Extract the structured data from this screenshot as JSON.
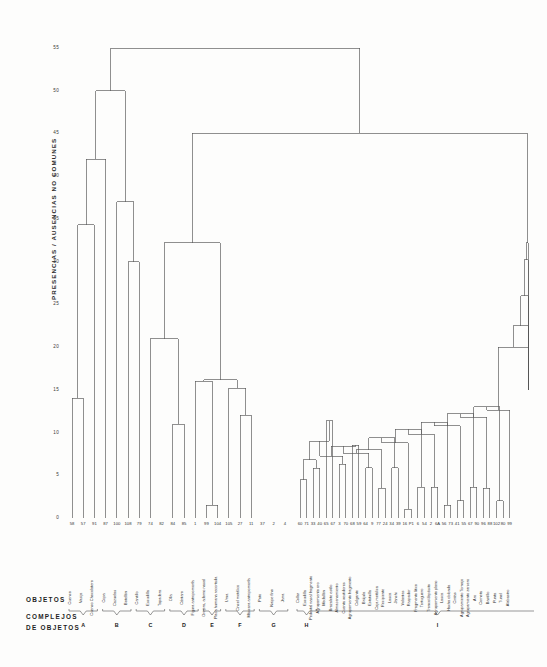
{
  "figure": {
    "kind": "dendrogram",
    "caption_objetos": "OBJETOS",
    "caption_complejos_line1": "COMPLEJOS",
    "caption_complejos_line2": "DE OBJETOS",
    "line_color": "#555555",
    "background": "#fdfdfc"
  },
  "chart_data": {
    "type": "dendrogram",
    "title": "",
    "xlabel": "OBJETOS",
    "ylabel": "PRESENCIAS / AUSENCIAS NO COMUNES",
    "ylim": [
      0,
      55
    ],
    "yticks": [
      0,
      5,
      10,
      15,
      20,
      25,
      30,
      35,
      40,
      45,
      50,
      55
    ],
    "grid": false,
    "legend": "none",
    "orientation": "vertical",
    "n_leaves": 60,
    "leaf_ids": [
      "58",
      "57",
      "91",
      "87",
      "100",
      "108",
      "79",
      "74",
      "82",
      "84",
      "85",
      "1",
      "99",
      "104",
      "105",
      "27",
      "11",
      "37",
      "2",
      "4",
      "60",
      "71",
      "33",
      "40",
      "65",
      "67",
      "3",
      "70",
      "68",
      "59",
      "64",
      "9",
      "77",
      "24",
      "34",
      "39",
      "16",
      "P1",
      "6",
      "54",
      "2",
      "6A",
      "56",
      "73",
      "41",
      "55",
      "67",
      "90",
      "96",
      "88",
      "102",
      "80",
      "99"
    ],
    "leaf_labels": [
      "Cuenco",
      "Vasija",
      "Cuenco Chocolatero",
      "Copa",
      "Cazuelas",
      "Botellón",
      "Cantillo",
      "Escudilla",
      "Tapadera",
      "Olla",
      "Cántaro",
      "Figura antropomorfa",
      "Orejera, adorno nasal",
      "Placa humana recortada",
      "Urna",
      "Cincel metálico",
      "Máscara antropomorfa",
      "Pato",
      "Naipe fino",
      "Jarra",
      "Collar",
      "Escudilla",
      "Pedestal nasal fragmento",
      "Agrupamiento oro",
      "Medallón",
      "Brazalete estilo",
      "Almacenamiento",
      "Cuenta vestidores",
      "Agrupamiento fragmento",
      "Colgante",
      "Brújula",
      "Estatuilla",
      "Caja metálica",
      "Recipiente",
      "Lasca",
      "Janchi",
      "Volantes",
      "Raspador",
      "Fragmento lítico",
      "Tortuguero",
      "Tronco/depósito",
      "Agrupamiento plano",
      "Lasca",
      "Hacha oblonda",
      "Cintas",
      "Agrupamiento Tornajo",
      "Agrupamiento zarcero",
      "Aro",
      "Corneta",
      "Bastillo",
      "Punta",
      "Tunel",
      "Alabastro"
    ],
    "clusters": [
      {
        "label": "A",
        "leaf_start": 0,
        "leaf_end": 2
      },
      {
        "label": "B",
        "leaf_start": 3,
        "leaf_end": 5
      },
      {
        "label": "C",
        "leaf_start": 6,
        "leaf_end": 8
      },
      {
        "label": "D",
        "leaf_start": 9,
        "leaf_end": 11
      },
      {
        "label": "E",
        "leaf_start": 12,
        "leaf_end": 13
      },
      {
        "label": "F",
        "leaf_start": 14,
        "leaf_end": 16
      },
      {
        "label": "G",
        "leaf_start": 17,
        "leaf_end": 19
      },
      {
        "label": "H",
        "leaf_start": 20,
        "leaf_end": 22
      },
      {
        "label": "I",
        "leaf_start": 23,
        "leaf_end": 59
      }
    ],
    "merges": [
      {
        "left": 0,
        "right": 1,
        "height": 14.0
      },
      {
        "left": 2,
        "right": "m0",
        "height": 34.3
      },
      {
        "left": 3,
        "right": "m1",
        "height": 42.0
      },
      {
        "left": 5,
        "right": 6,
        "height": 30.0
      },
      {
        "left": 4,
        "right": "m3",
        "height": 37.0
      },
      {
        "left": "m2",
        "right": "m4",
        "height": 50.0
      },
      {
        "left": 9,
        "right": 10,
        "height": 11.0
      },
      {
        "left": 7,
        "right": "m6",
        "height": 21.0
      },
      {
        "left": 12,
        "right": 13,
        "height": 1.5
      },
      {
        "left": 11,
        "right": "m8",
        "height": 16.0
      },
      {
        "left": 15,
        "right": 16,
        "height": 12.0
      },
      {
        "left": 14,
        "right": "m10",
        "height": 15.2
      },
      {
        "left": "m9",
        "right": "m11",
        "height": 16.2
      },
      {
        "left": "m7",
        "right": "m12",
        "height": 32.2
      },
      {
        "left": "m13",
        "right": "R",
        "height": 45.0
      },
      {
        "left": "m5",
        "right": "m14",
        "height": 55.0
      },
      {
        "left": 18,
        "right": 19,
        "height": 4.5
      },
      {
        "left": "m16",
        "right": 20,
        "height": 5.8
      },
      {
        "left": 21,
        "right": 22,
        "height": 11.4
      },
      {
        "left": 23,
        "right": 24,
        "height": 6.3
      },
      {
        "left": "m19",
        "right": 25,
        "height": 8.5
      },
      {
        "left": 26,
        "right": 27,
        "height": 5.9
      },
      {
        "left": 28,
        "right": 29,
        "height": 3.5
      },
      {
        "left": 30,
        "right": 31,
        "height": 5.9
      },
      {
        "left": 32,
        "right": 33,
        "height": 1.0
      },
      {
        "left": 34,
        "right": 35,
        "height": 3.6
      },
      {
        "left": 36,
        "right": 37,
        "height": 3.6
      },
      {
        "left": 38,
        "right": 39,
        "height": 1.5
      },
      {
        "left": 40,
        "right": 41,
        "height": 2.0
      },
      {
        "left": 42,
        "right": 43,
        "height": 3.6
      },
      {
        "left": 44,
        "right": 45,
        "height": 3.5
      },
      {
        "left": 46,
        "right": 47,
        "height": 2.0
      },
      {
        "left": 48,
        "right": 49,
        "height": 2.0
      },
      {
        "left": 50,
        "right": 51,
        "height": 6.4
      },
      {
        "left": 52,
        "right": 53,
        "height": 1.9
      }
    ]
  },
  "axis": {
    "ylabel_text": "PRESENCIAS / AUSENCIAS NO COMUNES",
    "ticks": [
      {
        "value": 55,
        "text": "55"
      },
      {
        "value": 50,
        "text": "50"
      },
      {
        "value": 45,
        "text": "45"
      },
      {
        "value": 40,
        "text": "40"
      },
      {
        "value": 35,
        "text": "35"
      },
      {
        "value": 30,
        "text": "30"
      },
      {
        "value": 25,
        "text": "25"
      },
      {
        "value": 20,
        "text": "20"
      },
      {
        "value": 15,
        "text": "15"
      },
      {
        "value": 10,
        "text": "10"
      },
      {
        "value": 5,
        "text": "5"
      },
      {
        "value": 0,
        "text": "0"
      }
    ]
  },
  "leaves": [
    {
      "id": "58",
      "name": "Cuenco"
    },
    {
      "id": "57",
      "name": "Vasija"
    },
    {
      "id": "91",
      "name": "Cuenco Chocolatero"
    },
    {
      "id": "87",
      "name": "Copa"
    },
    {
      "id": "100",
      "name": "Cazuelas"
    },
    {
      "id": "108",
      "name": "Botellón"
    },
    {
      "id": "79",
      "name": "Cantillo"
    },
    {
      "id": "74",
      "name": "Escudilla"
    },
    {
      "id": "82",
      "name": "Tapadera"
    },
    {
      "id": "84",
      "name": "Olla"
    },
    {
      "id": "85",
      "name": "Cántaro"
    },
    {
      "id": "1",
      "name": "Figura antropomorfa"
    },
    {
      "id": "99",
      "name": "Orejera, adorno nasal"
    },
    {
      "id": "104",
      "name": "Placa humana recortada"
    },
    {
      "id": "105",
      "name": "Urna"
    },
    {
      "id": "27",
      "name": "Cincel metálico"
    },
    {
      "id": "11",
      "name": "Máscara antropomorfa"
    },
    {
      "id": "37",
      "name": "Pato"
    },
    {
      "id": "2",
      "name": "Naipe fino"
    },
    {
      "id": "4",
      "name": "Jarra"
    },
    {
      "id": "60",
      "name": "Collar"
    },
    {
      "id": "71",
      "name": "Escudilla"
    },
    {
      "id": "33",
      "name": "Pedestal nasal fragmento"
    },
    {
      "id": "40",
      "name": "Agrupamiento oro"
    },
    {
      "id": "65",
      "name": "Medallón"
    },
    {
      "id": "67",
      "name": "Brazalete estilo"
    },
    {
      "id": "3",
      "name": "Almacenamiento"
    },
    {
      "id": "70",
      "name": "Cuenta vestidores"
    },
    {
      "id": "68",
      "name": "Agrupamiento fragmento"
    },
    {
      "id": "59",
      "name": "Colgante"
    },
    {
      "id": "64",
      "name": "Brújula"
    },
    {
      "id": "9",
      "name": "Estatuilla"
    },
    {
      "id": "77",
      "name": "Caja metálica"
    },
    {
      "id": "24",
      "name": "Recipiente"
    },
    {
      "id": "34",
      "name": "Lasca"
    },
    {
      "id": "39",
      "name": "Janchi"
    },
    {
      "id": "16",
      "name": "Volantes"
    },
    {
      "id": "P1",
      "name": "Raspador"
    },
    {
      "id": "6",
      "name": "Fragmento lítico"
    },
    {
      "id": "54",
      "name": "Tortuguero"
    },
    {
      "id": "2",
      "name": "Tronco/depósito"
    },
    {
      "id": "6A",
      "name": "Agrupamiento plano"
    },
    {
      "id": "56",
      "name": "Lasca"
    },
    {
      "id": "73",
      "name": "Hacha oblonda"
    },
    {
      "id": "41",
      "name": "Cintas"
    },
    {
      "id": "55",
      "name": "Agrupamiento Tornajo"
    },
    {
      "id": "67",
      "name": "Agrupamiento zarcero"
    },
    {
      "id": "90",
      "name": "Aro"
    },
    {
      "id": "96",
      "name": "Corneta"
    },
    {
      "id": "88",
      "name": "Bastillo"
    },
    {
      "id": "102",
      "name": "Punta"
    },
    {
      "id": "80",
      "name": "Tunel"
    },
    {
      "id": "99",
      "name": "Alabastro"
    }
  ],
  "cluster_labels": [
    "A",
    "B",
    "C",
    "D",
    "E",
    "F",
    "G",
    "H",
    "I"
  ]
}
